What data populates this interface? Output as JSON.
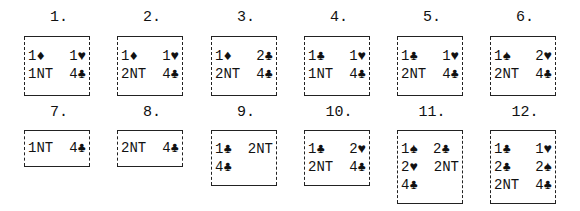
{
  "diagrams": [
    {
      "label": "1.",
      "rows": [
        [
          "1♦",
          "1♥"
        ],
        [
          "1NT",
          "4♣"
        ]
      ]
    },
    {
      "label": "2.",
      "rows": [
        [
          "1♦",
          "1♥"
        ],
        [
          "2NT",
          "4♣"
        ]
      ]
    },
    {
      "label": "3.",
      "rows": [
        [
          "1♦",
          "2♣"
        ],
        [
          "2NT",
          "4♣"
        ]
      ]
    },
    {
      "label": "4.",
      "rows": [
        [
          "1♣",
          "1♥"
        ],
        [
          "1NT",
          "4♣"
        ]
      ]
    },
    {
      "label": "5.",
      "rows": [
        [
          "1♣",
          "1♥"
        ],
        [
          "2NT",
          "4♣"
        ]
      ]
    },
    {
      "label": "6.",
      "rows": [
        [
          "1♠",
          "2♥"
        ],
        [
          "2NT",
          "4♣"
        ]
      ]
    },
    {
      "label": "7.",
      "rows": [
        [
          "1NT",
          "4♣"
        ]
      ]
    },
    {
      "label": "8.",
      "rows": [
        [
          "2NT",
          "4♣"
        ]
      ]
    },
    {
      "label": "9.",
      "rows": [
        [
          "1♣",
          "2NT"
        ],
        [
          "4♣",
          ""
        ]
      ]
    },
    {
      "label": "10.",
      "rows": [
        [
          "1♣",
          "2♥"
        ],
        [
          "2NT",
          "4♣"
        ]
      ]
    },
    {
      "label": "11.",
      "rows": [
        [
          "1♠",
          "2♣"
        ],
        [
          "2♥",
          "2NT"
        ],
        [
          "4♣",
          ""
        ]
      ]
    },
    {
      "label": "12.",
      "rows": [
        [
          "1♣",
          "1♥"
        ],
        [
          "2♣",
          "2♠"
        ],
        [
          "2NT",
          "4♣"
        ]
      ]
    }
  ]
}
